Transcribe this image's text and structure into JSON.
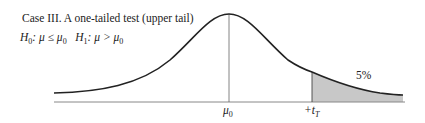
{
  "diagram": {
    "title": "Case III. A one-tailed test (upper tail)",
    "hypotheses": {
      "h0_label": "H",
      "h0_sub": "0",
      "h0_text": ": μ ≤ μ",
      "h0_sub2": "0",
      "h1_label": "H",
      "h1_sub": "1",
      "h1_text": ": μ > μ",
      "h1_sub2": "0"
    },
    "axis_labels": {
      "mean": "μ",
      "mean_sub": "0",
      "critical": "+t",
      "critical_sub": "T"
    },
    "tail_area_label": "5%",
    "colors": {
      "curve": "#222222",
      "axis": "#888888",
      "shade": "#c8c8c8"
    }
  }
}
